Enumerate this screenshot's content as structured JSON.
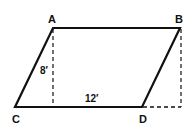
{
  "diagram": {
    "type": "parallelogram",
    "vertices": {
      "A": {
        "label": "A",
        "x": 53,
        "y": 28
      },
      "B": {
        "label": "B",
        "x": 180,
        "y": 28
      },
      "C": {
        "label": "C",
        "x": 15,
        "y": 107
      },
      "D": {
        "label": "D",
        "x": 142,
        "y": 107
      }
    },
    "height_label": "8′",
    "base_label": "12′",
    "colors": {
      "stroke": "#111111",
      "background": "#ffffff"
    }
  }
}
